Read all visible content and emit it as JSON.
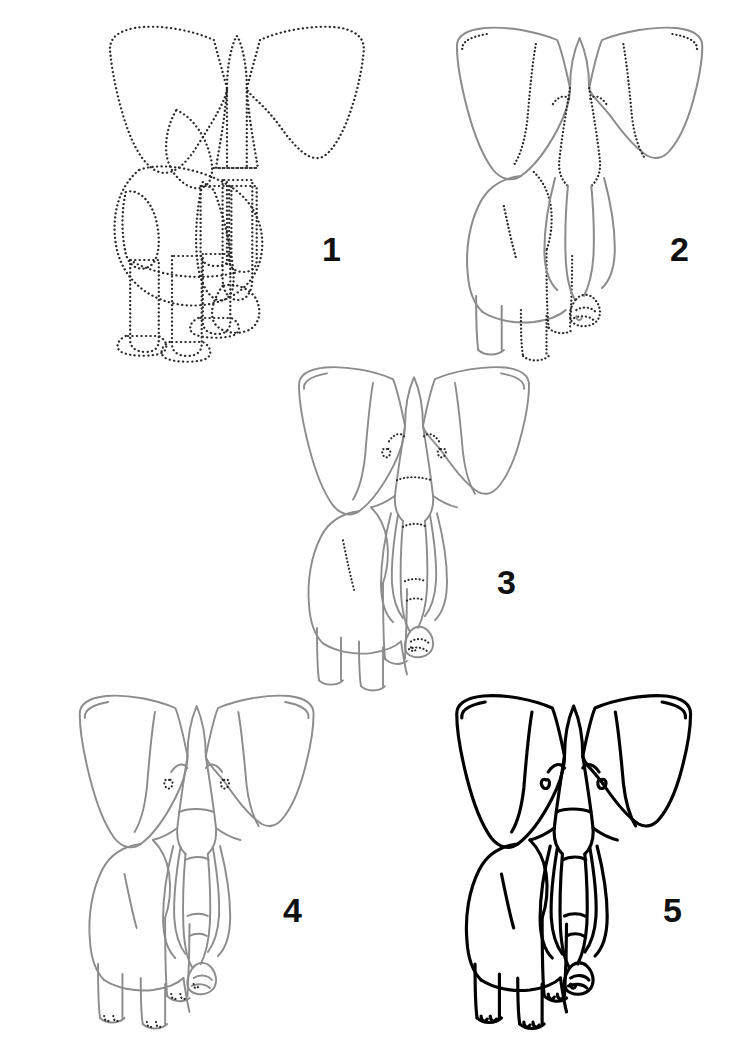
{
  "page": {
    "background_color": "#ffffff",
    "width": 744,
    "height": 1050,
    "orientation": "portrait",
    "sheet_type": "step-by-step drawing tutorial"
  },
  "style": {
    "guide_stroke_color": "#2b2b2b",
    "guide_stroke_style": "dotted",
    "guide_stroke_width": 2.2,
    "construction_stroke_color": "#8c8c8c",
    "construction_stroke_width": 1.9,
    "final_stroke_color": "#000000",
    "final_stroke_width": 3.1,
    "number_color": "#111111",
    "number_font_size": 34,
    "number_font_weight": "bold",
    "fill": "none"
  },
  "steps": [
    {
      "number": "1",
      "label": "Step 1",
      "caption": "Block in the head, ears, body and legs with dotted guide shapes",
      "line_mode": "all-dotted",
      "stroke_color": "#2b2b2b",
      "number_position": {
        "x": 322,
        "y": 232
      },
      "bounds": {
        "x": 62,
        "y": 10,
        "width": 330,
        "height": 350
      }
    },
    {
      "number": "2",
      "label": "Step 2",
      "caption": "Trace the outer silhouette in solid line; keep inner guides dotted",
      "line_mode": "mixed-solid-and-dotted",
      "stroke_color": "#8c8c8c",
      "number_position": {
        "x": 670,
        "y": 232
      },
      "bounds": {
        "x": 410,
        "y": 10,
        "width": 320,
        "height": 350
      }
    },
    {
      "number": "3",
      "label": "Step 3",
      "caption": "Refine the head, add tusks and trunk; dotted marks for eyes and wrinkles",
      "line_mode": "solid-with-dotted-details",
      "stroke_color": "#8c8c8c",
      "number_position": {
        "x": 497,
        "y": 565
      },
      "bounds": {
        "x": 255,
        "y": 350,
        "width": 300,
        "height": 340
      }
    },
    {
      "number": "4",
      "label": "Step 4",
      "caption": "Complete all contour lines; dotted toenails remain as guides",
      "line_mode": "solid-complete",
      "stroke_color": "#8c8c8c",
      "number_position": {
        "x": 283,
        "y": 893
      },
      "bounds": {
        "x": 35,
        "y": 678,
        "width": 305,
        "height": 350
      }
    },
    {
      "number": "5",
      "label": "Step 5",
      "caption": "Ink the finished drawing in bold black line",
      "line_mode": "final-bold-black",
      "stroke_color": "#000000",
      "number_position": {
        "x": 663,
        "y": 893
      },
      "bounds": {
        "x": 412,
        "y": 678,
        "width": 305,
        "height": 350
      }
    }
  ]
}
